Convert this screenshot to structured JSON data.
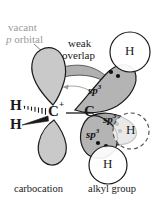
{
  "figure": {
    "annotations": {
      "vacant_orbital_line1": "vacant",
      "vacant_orbital_line2_italic": "p",
      "vacant_orbital_line2_rest": " orbital",
      "weak_overlap_line1": "weak",
      "weak_overlap_line2": "overlap"
    },
    "atoms": {
      "carbocation_carbon": "C",
      "carbocation_charge": "+",
      "alkyl_carbon": "C",
      "hydrogen_hashed": "H",
      "hydrogen_wedge": "H",
      "hydrogen_top_circle": "H",
      "hydrogen_bottom_circle": "H",
      "hydrogen_dashed_circle": "H"
    },
    "orbital_labels": {
      "sp3_base": "sp",
      "sp3_exponent": "3",
      "sp3_upper": "sp3",
      "sp3_middle": "sp3",
      "sp3_lower": "sp3"
    },
    "captions": {
      "left": "carbocation",
      "right": "alkyl group"
    },
    "colors": {
      "p_orbital_fill": "#c9c9c9",
      "sp3_orbital_fill": "#b4b4b4",
      "sp3_orbital_fill_dark": "#a6a6a6",
      "overlap_band_fill": "#b0b0b0",
      "outline": "#1a1a1a",
      "gray_text": "#9a9a9a",
      "circle_fill": "#ffffff",
      "background": "#ffffff"
    }
  }
}
